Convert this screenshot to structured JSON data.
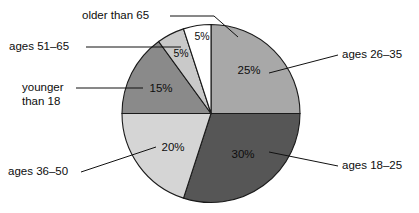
{
  "chart_data": {
    "type": "pie",
    "title": "",
    "subtitle": "",
    "xlabel": "",
    "ylabel": "",
    "legend_position": "callout-labels",
    "grid": false,
    "start_angle_deg": 0,
    "direction": "clockwise",
    "units": "percent",
    "categories": [
      "ages 26–35",
      "ages 18–25",
      "ages 36–50",
      "younger than 18",
      "ages 51–65",
      "older than 65"
    ],
    "values": [
      25,
      30,
      20,
      15,
      5,
      5
    ],
    "value_labels": [
      "25%",
      "30%",
      "20%",
      "15%",
      "5%",
      "5%"
    ],
    "colors": [
      "#a8a8a8",
      "#565656",
      "#d5d5d5",
      "#8a8a8a",
      "#c9c9c9",
      "#ffffff"
    ],
    "slices": [
      {
        "label": "ages 26–35",
        "value": 25,
        "value_label": "25%",
        "color": "#a8a8a8",
        "start_deg": 0,
        "end_deg": 90
      },
      {
        "label": "ages 18–25",
        "value": 30,
        "value_label": "30%",
        "color": "#565656",
        "start_deg": 90,
        "end_deg": 198
      },
      {
        "label": "ages 36–50",
        "value": 20,
        "value_label": "20%",
        "color": "#d5d5d5",
        "start_deg": 198,
        "end_deg": 270
      },
      {
        "label": "younger than 18",
        "value": 15,
        "value_label": "15%",
        "color": "#8a8a8a",
        "start_deg": 270,
        "end_deg": 324
      },
      {
        "label": "ages 51–65",
        "value": 5,
        "value_label": "5%",
        "color": "#c9c9c9",
        "start_deg": 324,
        "end_deg": 342
      },
      {
        "label": "older than 65",
        "value": 5,
        "value_label": "5%",
        "color": "#ffffff",
        "start_deg": 342,
        "end_deg": 360
      }
    ]
  },
  "labels": {
    "older_than_65": "older than 65",
    "ages_51_65": "ages 51–65",
    "younger_than_18_line1": "younger",
    "younger_than_18_line2": "than 18",
    "ages_36_50": "ages 36–50",
    "ages_26_35": "ages 26–35",
    "ages_18_25": "ages 18–25"
  },
  "values": {
    "v25": "25%",
    "v30": "30%",
    "v20": "20%",
    "v15": "15%",
    "v5_ages51_65": "5%",
    "v5_older65": "5%"
  },
  "style": {
    "background": "#ffffff",
    "outline": "#1a1a1a",
    "text": "#0d0d0d"
  }
}
